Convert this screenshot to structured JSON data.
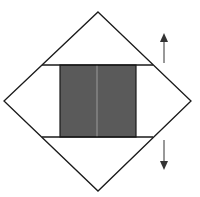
{
  "diagram": {
    "title": "",
    "width": 200,
    "height": 197,
    "colors": {
      "background": "#ffffff",
      "stroke": "#1a1a1a",
      "fill_dark": "#5a5a5a",
      "divider_light": "#9a9a9a",
      "arrow": "#333333"
    },
    "diamond": {
      "top": [
        98,
        12
      ],
      "right": [
        191,
        101
      ],
      "bottom": [
        98,
        191
      ],
      "left": [
        4,
        101
      ]
    },
    "horizontal_lines": [
      {
        "name": "upper-chord",
        "y": 65,
        "x1": 42,
        "x2": 153
      },
      {
        "name": "lower-chord",
        "y": 137,
        "x1": 42,
        "x2": 153
      }
    ],
    "shaded_rect": {
      "x": 60,
      "y": 65,
      "width": 76,
      "height": 72
    },
    "center_divider": {
      "x": 97,
      "y1": 65,
      "y2": 137
    },
    "arrows": [
      {
        "name": "up-arrow",
        "direction": "up",
        "x": 164,
        "y_tail": 63,
        "y_head": 33
      },
      {
        "name": "down-arrow",
        "direction": "down",
        "x": 164,
        "y_tail": 140,
        "y_head": 170
      }
    ]
  }
}
